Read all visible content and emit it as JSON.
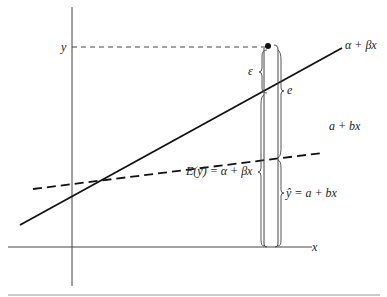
{
  "diagram": {
    "type": "regression-line-illustration",
    "axes": {
      "x_label": "x",
      "y_label": "y"
    },
    "lines": [
      {
        "name": "population-regression-line",
        "label": "α + βx",
        "style": "solid"
      },
      {
        "name": "sample-regression-line",
        "label": "a + bx",
        "style": "dashed"
      }
    ],
    "annotations": {
      "epsilon": "ε",
      "residual": "e",
      "expected": "E(y) = α + βx",
      "fitted": "ŷ = a + bx"
    },
    "colors": {
      "line": "#111111",
      "axis": "#333333",
      "background": "#ffffff"
    }
  }
}
